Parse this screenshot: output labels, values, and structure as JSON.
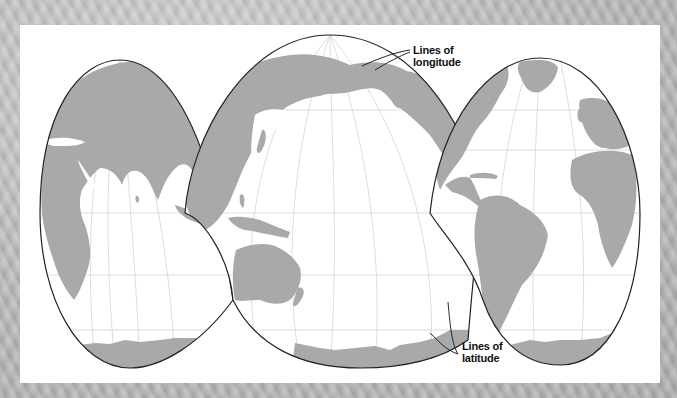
{
  "figure": {
    "type": "interrupted map projection",
    "background_color": "#b9b9b9",
    "panel_color": "#ffffff",
    "land_color": "#a9a9a9",
    "outline_color": "#222222",
    "graticule_color": "#cfcfcf"
  },
  "annotations": {
    "longitude": {
      "line1": "Lines of",
      "line2": "longitude"
    },
    "latitude": {
      "line1": "Lines of",
      "line2": "latitude"
    }
  },
  "lobes": [
    {
      "name": "Europe-Africa-Asia (west lobe)",
      "regions": [
        "Europe",
        "Africa",
        "Arabian Peninsula",
        "India",
        "Madagascar",
        "Antarctica"
      ]
    },
    {
      "name": "Pacific lobe",
      "regions": [
        "Asia",
        "Alaska",
        "North America west coast",
        "Indonesia",
        "Australia",
        "New Zealand",
        "Antarctica"
      ]
    },
    {
      "name": "Atlantic lobe",
      "regions": [
        "Greenland",
        "Europe",
        "Africa",
        "Central America",
        "Caribbean",
        "South America",
        "Antarctica"
      ]
    }
  ]
}
